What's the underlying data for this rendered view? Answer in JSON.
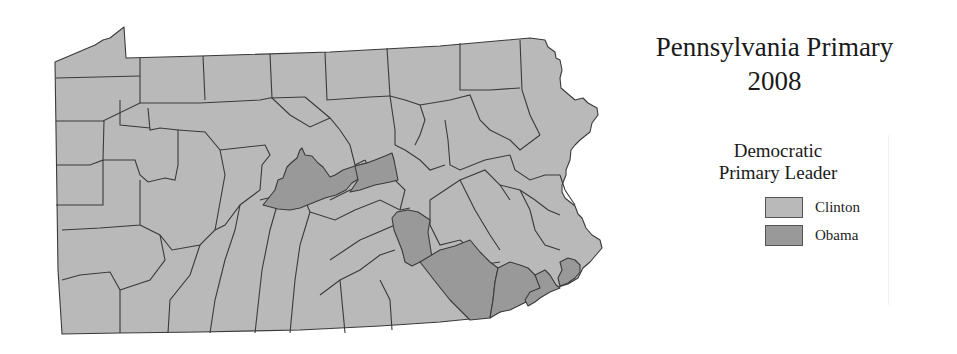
{
  "title": {
    "line1": "Pennsylvania Primary",
    "line2": "2008"
  },
  "legend": {
    "title_line1": "Democratic",
    "title_line2": "Primary Leader",
    "items": [
      {
        "label": "Clinton",
        "color": "#b9b9b9"
      },
      {
        "label": "Obama",
        "color": "#999999"
      }
    ]
  },
  "map": {
    "region": "Pennsylvania counties",
    "colors": {
      "clinton": "#b9b9b9",
      "obama": "#999999",
      "border": "#3a3a3a"
    },
    "obama_counties_visible": 7,
    "note": "Most counties shaded as Clinton leader; a central cluster and southeastern counties shaded as Obama leader"
  }
}
